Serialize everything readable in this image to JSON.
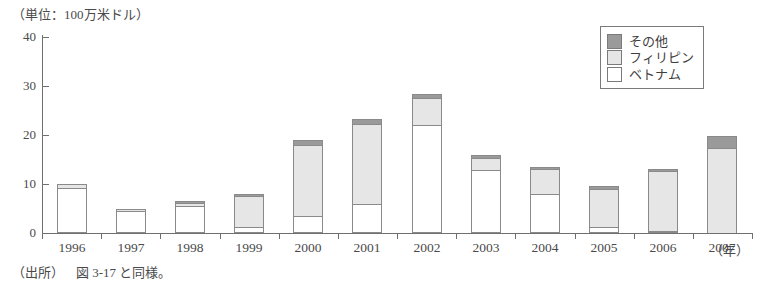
{
  "figure": {
    "unit_label": "（単位：100万米ドル）",
    "x_axis_unit": "（年）",
    "source_prefix": "（出所）",
    "source_text": "図 3-17 と同様。"
  },
  "legend": {
    "position": "top-right",
    "items": [
      {
        "label": "その他",
        "color": "#9a9a9a",
        "key": "other"
      },
      {
        "label": "フィリピン",
        "color": "#e6e6e6",
        "key": "philippines"
      },
      {
        "label": "ベトナム",
        "color": "#ffffff",
        "key": "vietnam"
      }
    ]
  },
  "chart_data": {
    "type": "bar",
    "stacked": true,
    "title": "",
    "subtitle": "",
    "xlabel": "（年）",
    "ylabel": "（単位：100万米ドル）",
    "ylim": [
      0,
      40
    ],
    "yticks": [
      0,
      10,
      20,
      30,
      40
    ],
    "ytick_labels": [
      "0",
      "10",
      "20",
      "30",
      "40"
    ],
    "grid": false,
    "legend_position": "top-right",
    "categories": [
      "1996",
      "1997",
      "1998",
      "1999",
      "2000",
      "2001",
      "2002",
      "2003",
      "2004",
      "2005",
      "2006",
      "2007"
    ],
    "series": [
      {
        "name": "ベトナム",
        "color": "#ffffff",
        "values": [
          9.2,
          4.4,
          5.6,
          1.2,
          3.5,
          6.0,
          22.0,
          12.9,
          8.0,
          1.3,
          0.3,
          0.0
        ]
      },
      {
        "name": "フィリピン",
        "color": "#e6e6e6",
        "values": [
          0.8,
          0.5,
          0.6,
          6.4,
          14.5,
          16.3,
          5.5,
          2.4,
          5.0,
          7.7,
          12.2,
          17.4
        ]
      },
      {
        "name": "その他",
        "color": "#9a9a9a",
        "values": [
          0.0,
          0.0,
          0.1,
          0.4,
          1.0,
          1.0,
          0.8,
          0.7,
          0.5,
          0.5,
          0.5,
          2.3
        ]
      }
    ],
    "totals": [
      10.0,
      4.9,
      6.3,
      8.0,
      19.0,
      23.3,
      28.3,
      16.0,
      13.5,
      9.5,
      13.0,
      19.7
    ]
  }
}
